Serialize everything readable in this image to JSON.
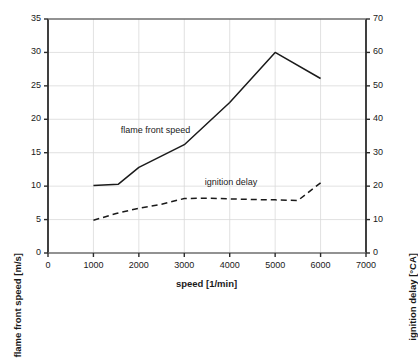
{
  "chart_data": {
    "type": "line",
    "title": "",
    "xlabel": "speed [1/min]",
    "ylabel": "flame front speed [m/s]",
    "ylabel_right": "ignition delay [°CA]",
    "xlim": [
      0,
      7000
    ],
    "ylim": [
      0,
      35
    ],
    "ylim_right": [
      0,
      70
    ],
    "xticks": [
      "0",
      "1000",
      "2000",
      "3000",
      "4000",
      "5000",
      "6000",
      "7000"
    ],
    "xtick_values": [
      0,
      1000,
      2000,
      3000,
      4000,
      5000,
      6000,
      7000
    ],
    "yticks": [
      "0",
      "5",
      "10",
      "15",
      "20",
      "25",
      "30",
      "35"
    ],
    "ytick_values": [
      0,
      5,
      10,
      15,
      20,
      25,
      30,
      35
    ],
    "yticks_right": [
      "0",
      "10",
      "20",
      "30",
      "40",
      "50",
      "60",
      "70"
    ],
    "ytick_right_values": [
      0,
      10,
      20,
      30,
      40,
      50,
      60,
      70
    ],
    "grid": true,
    "legend_position": "inline-annotation",
    "series": [
      {
        "name": "flame front speed",
        "axis": "left",
        "style": "solid",
        "color": "#1a1a1a",
        "annotation": "flame front speed",
        "annotation_x": 1600,
        "annotation_y": 18.2,
        "x": [
          1000,
          1550,
          2000,
          3000,
          4000,
          5000,
          6000
        ],
        "values": [
          10.1,
          10.3,
          12.8,
          16.2,
          22.5,
          30.0,
          26.1
        ]
      },
      {
        "name": "ignition delay",
        "axis": "right",
        "style": "dashed",
        "color": "#1a1a1a",
        "annotation": "ignition delay",
        "annotation_x": 3450,
        "annotation_y_right": 21.0,
        "x": [
          1000,
          1500,
          2000,
          2500,
          3000,
          3500,
          4000,
          4500,
          5000,
          5500,
          6000
        ],
        "values": [
          9.8,
          11.8,
          13.4,
          14.6,
          16.3,
          16.4,
          16.2,
          16.0,
          15.9,
          15.7,
          21.0
        ]
      }
    ]
  },
  "plot": {
    "left_px": 48,
    "right_px": 366,
    "top_px": 19,
    "bottom_px": 253
  }
}
